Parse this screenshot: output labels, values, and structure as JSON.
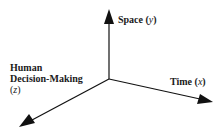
{
  "diagram": {
    "type": "3d-axes",
    "axes": [
      {
        "id": "y",
        "label": "Space",
        "var": "y",
        "direction": "up"
      },
      {
        "id": "x",
        "label": "Time",
        "var": "x",
        "direction": "right-down"
      },
      {
        "id": "z",
        "label_line1": "Human",
        "label_line2": "Decision-Making",
        "var": "z",
        "direction": "left-down"
      }
    ],
    "colors": {
      "line": "#111111",
      "text": "#1a1a1a",
      "background": "#ffffff"
    }
  }
}
